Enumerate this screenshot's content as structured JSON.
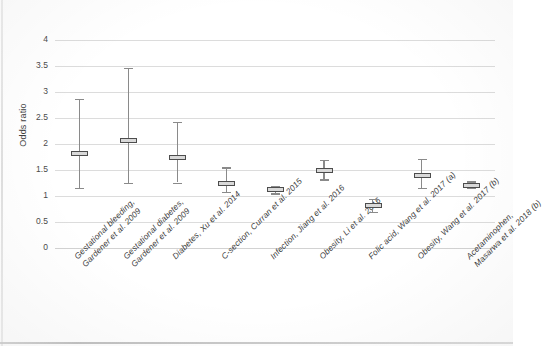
{
  "chart_data": {
    "type": "scatter",
    "title": "",
    "subtitle": "",
    "xlabel": "",
    "ylabel": "Odds ratio",
    "ylim": [
      0,
      4
    ],
    "ytick_labels": [
      "0",
      "0.5",
      "1",
      "1.5",
      "2",
      "2.5",
      "3",
      "3.5",
      "4"
    ],
    "ytick_values": [
      0,
      0.5,
      1,
      1.5,
      2,
      2.5,
      3,
      3.5,
      4
    ],
    "grid": true,
    "legend": "none",
    "error_bar_type": "95% confidence interval",
    "categories": [
      "Gestational bleeding, Gardener et al. 2009",
      "Gestational diabetes, Gardener et al. 2009",
      "Diabetes, Xu et al. 2014",
      "C-section, Curran et al. 2015",
      "Infection, Jiang et al. 2016",
      "Obesity, Li et al. 2016",
      "Folic acid, Wang et al. 2017 (a)",
      "Obesity, Wang et al. 2017 (b)",
      "Acetaminophen, Masarwa et al. 2018 (b)"
    ],
    "category_lines": [
      [
        "Gestational bleeding,",
        "Gardener et al. 2009"
      ],
      [
        "Gestational diabetes,",
        "Gardener et al. 2009"
      ],
      [
        "Diabetes, Xu et al. 2014"
      ],
      [
        "C-section, Curran et al. 2015"
      ],
      [
        "Infection, Jiang et al. 2016"
      ],
      [
        "Obesity, Li et al. 2016"
      ],
      [
        "Folic acid, Wang et al. 2017 (a)"
      ],
      [
        "Obesity, Wang et al. 2017 (b)"
      ],
      [
        "Acetaminophen,",
        "Masarwa et al. 2018 (b)"
      ]
    ],
    "values": [
      1.81,
      2.07,
      1.74,
      1.25,
      1.12,
      1.5,
      0.81,
      1.4,
      1.21
    ],
    "ci_lower": [
      1.15,
      1.25,
      1.26,
      1.08,
      1.05,
      1.32,
      0.69,
      1.15,
      1.15
    ],
    "ci_upper": [
      2.87,
      3.47,
      2.42,
      1.55,
      1.2,
      1.7,
      0.94,
      1.71,
      1.28
    ],
    "series": [
      {
        "name": "Odds ratio (95% CI)",
        "points": [
          {
            "label": "Gestational bleeding, Gardener et al. 2009",
            "value": 1.81,
            "low": 1.15,
            "high": 2.87
          },
          {
            "label": "Gestational diabetes, Gardener et al. 2009",
            "value": 2.07,
            "low": 1.25,
            "high": 3.47
          },
          {
            "label": "Diabetes, Xu et al. 2014",
            "value": 1.74,
            "low": 1.26,
            "high": 2.42
          },
          {
            "label": "C-section, Curran et al. 2015",
            "value": 1.25,
            "low": 1.08,
            "high": 1.55
          },
          {
            "label": "Infection, Jiang et al. 2016",
            "value": 1.12,
            "low": 1.05,
            "high": 1.2
          },
          {
            "label": "Obesity, Li et al. 2016",
            "value": 1.5,
            "low": 1.32,
            "high": 1.7
          },
          {
            "label": "Folic acid, Wang et al. 2017 (a)",
            "value": 0.81,
            "low": 0.69,
            "high": 0.94
          },
          {
            "label": "Obesity, Wang et al. 2017 (b)",
            "value": 1.4,
            "low": 1.15,
            "high": 1.71
          },
          {
            "label": "Acetaminophen, Masarwa et al. 2018 (b)",
            "value": 1.21,
            "low": 1.15,
            "high": 1.28
          }
        ]
      }
    ],
    "colors": {
      "marker_fill": "#d9d9d9",
      "marker_edge": "#4d4d4d",
      "whisker": "#8a8a8a",
      "gridline": "#dcdcdc",
      "text": "#3a3a3a",
      "background": "#ffffff"
    }
  }
}
